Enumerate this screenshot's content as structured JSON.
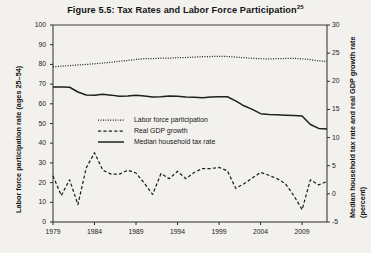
{
  "chart_data": {
    "type": "line",
    "title": "Figure 5.5: Tax Rates and Labor Force Participation",
    "title_footnote": "25",
    "xlabel": "",
    "ylabel": "Labor force participation rate (ages 25–54)",
    "y2label_line1": "Median household tax rate  and real GDP growth rate",
    "y2label_line2": "(percent)",
    "xlim": [
      1979,
      2012
    ],
    "ylim": [
      0,
      100
    ],
    "y2lim": [
      -5,
      30
    ],
    "grid": false,
    "legend_position": "center-left",
    "yticks": [
      0,
      10,
      20,
      30,
      40,
      50,
      60,
      70,
      80,
      90,
      100
    ],
    "y2ticks": [
      -5,
      0,
      5,
      10,
      15,
      20,
      25,
      30
    ],
    "xticks": [
      1979,
      1984,
      1989,
      1994,
      1999,
      2004,
      2009
    ],
    "x": [
      1979,
      1980,
      1981,
      1982,
      1983,
      1984,
      1985,
      1986,
      1987,
      1988,
      1989,
      1990,
      1991,
      1992,
      1993,
      1994,
      1995,
      1996,
      1997,
      1998,
      1999,
      2000,
      2001,
      2002,
      2003,
      2004,
      2005,
      2006,
      2007,
      2008,
      2009,
      2010,
      2011,
      2012
    ],
    "series": [
      {
        "name": "Labor force participation",
        "style": "dotted",
        "axis": "left",
        "unit": "percent",
        "values": [
          78.8,
          79.1,
          79.4,
          79.7,
          80.0,
          80.3,
          80.7,
          81.1,
          81.6,
          82.0,
          82.5,
          82.9,
          82.9,
          83.2,
          83.2,
          83.4,
          83.5,
          83.7,
          83.9,
          84.0,
          84.1,
          84.0,
          83.7,
          83.4,
          83.1,
          82.9,
          82.8,
          82.9,
          83.0,
          83.1,
          82.8,
          82.4,
          81.8,
          81.5
        ]
      },
      {
        "name": "Real GDP growth",
        "style": "dashed",
        "axis": "right",
        "unit": "percent",
        "values": [
          3.2,
          -0.3,
          2.5,
          -1.9,
          4.6,
          7.3,
          4.2,
          3.5,
          3.5,
          4.2,
          3.7,
          1.9,
          -0.1,
          3.6,
          2.7,
          4.0,
          2.7,
          3.8,
          4.5,
          4.5,
          4.7,
          4.1,
          1.0,
          1.8,
          2.8,
          3.8,
          3.3,
          2.7,
          1.8,
          -0.3,
          -2.8,
          2.5,
          1.6,
          2.2
        ]
      },
      {
        "name": "Median household tax rate",
        "style": "solid",
        "axis": "left",
        "unit": "percent_scaled_left",
        "values": [
          68.5,
          68.5,
          68.4,
          66.0,
          64.5,
          64.3,
          64.8,
          64.4,
          63.8,
          63.9,
          64.3,
          64.0,
          63.5,
          63.6,
          64.0,
          63.8,
          63.5,
          63.3,
          63.1,
          63.4,
          63.6,
          63.6,
          61.5,
          59.0,
          57.2,
          55.0,
          54.6,
          54.4,
          54.2,
          54.0,
          53.8,
          49.5,
          47.5,
          47.2
        ]
      }
    ],
    "legend": [
      {
        "label": "Labor force participation",
        "style": "dotted"
      },
      {
        "label": "Real GDP growth",
        "style": "dashed"
      },
      {
        "label": "Median household tax rate",
        "style": "solid"
      }
    ]
  },
  "plot_geometry": {
    "left": 53,
    "right": 327,
    "top": 25,
    "bottom": 222
  }
}
